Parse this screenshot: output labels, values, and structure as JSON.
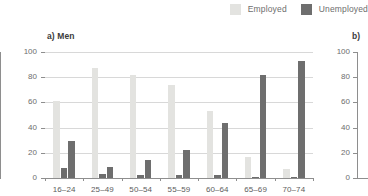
{
  "legend": {
    "items": [
      {
        "label": "Employed",
        "color": "#e3e3e0",
        "icon": "legend-swatch-employed"
      },
      {
        "label": "Unemployed",
        "color": "#6e6e6e",
        "icon": "legend-swatch-unemployed"
      }
    ]
  },
  "panels": {
    "a": {
      "title": "a) Men"
    },
    "b": {
      "title": "b)"
    }
  },
  "colors": {
    "employed": "#e3e3e0",
    "unemployed_light": "#6e6e6e",
    "unemployed_dark": "#6e6e6e",
    "axis": "#8e8e8e",
    "grid": "#d8d8d8",
    "tick_text": "#6d6d6d",
    "category_text": "#5c5c5c",
    "title_text": "#3b3b3b",
    "background": "#ffffff"
  },
  "chart_data": {
    "type": "bar",
    "title": "a) Men",
    "xlabel": "",
    "ylabel": "",
    "ylim": [
      0,
      100
    ],
    "yticks": [
      0,
      20,
      40,
      60,
      80,
      100
    ],
    "ytick_labels": [
      "0",
      "20",
      "40",
      "60",
      "80",
      "100"
    ],
    "grid": true,
    "legend_position": "top-right",
    "categories": [
      "16–24",
      "25–49",
      "50–54",
      "55–59",
      "60–64",
      "65–69",
      "70–74"
    ],
    "series": [
      {
        "name": "Employed",
        "color": "#e3e3e0",
        "values": [
          61,
          87,
          82,
          74,
          53,
          17,
          7
        ]
      },
      {
        "name": "Series2",
        "color": "#6e6e6e",
        "values": [
          8,
          3.5,
          2.5,
          2.5,
          2,
          0.8,
          0.5
        ]
      },
      {
        "name": "Unemployed",
        "color": "#6e6e6e",
        "values": [
          29.5,
          8.5,
          14,
          22.5,
          44,
          82,
          93
        ]
      }
    ]
  },
  "chart_data_b": {
    "type": "bar",
    "title": "b)",
    "ylim": [
      0,
      100
    ],
    "yticks": [
      0,
      20,
      40,
      60,
      80,
      100
    ],
    "ytick_labels": [
      "0",
      "20",
      "40",
      "60",
      "80",
      "100"
    ],
    "note": "panel cropped at right edge of screenshot"
  }
}
